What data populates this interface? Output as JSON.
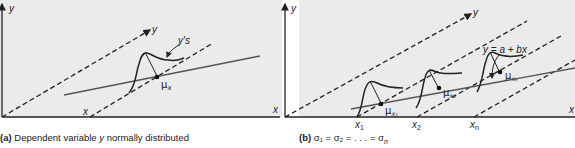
{
  "panels": {
    "a": {
      "caption_tag": "(a)",
      "caption_text": "Dependent variable ",
      "caption_var": "y",
      "caption_rest": " normally distributed",
      "axis_y_label": "y",
      "axis_x_label": "x",
      "dashed_y_label": "y",
      "dashed_x_label": "x",
      "distribution_label": "y's",
      "mean_label": "μ",
      "mean_sub": "x"
    },
    "b": {
      "caption_tag": "(b)",
      "caption_formula": "σ₁ = σ₂ = . . . = σ",
      "caption_formula_sub": "n",
      "axis_y_label": "y",
      "axis_x_label": "x",
      "dashed_y_label": "y",
      "regression_label": "y = a + bx",
      "x_ticks": [
        {
          "label": "x",
          "sub": "1"
        },
        {
          "label": "x",
          "sub": "2"
        },
        {
          "label": "x",
          "sub": "n"
        }
      ],
      "mean_labels": [
        {
          "label": "μ",
          "sub": "x₁"
        },
        {
          "label": "μ",
          "sub": "x₂"
        },
        {
          "label": "μ",
          "sub": "xₙ"
        }
      ]
    }
  },
  "colors": {
    "background": "#ebebeb",
    "ink": "#222222",
    "regression_line": "#555555"
  }
}
